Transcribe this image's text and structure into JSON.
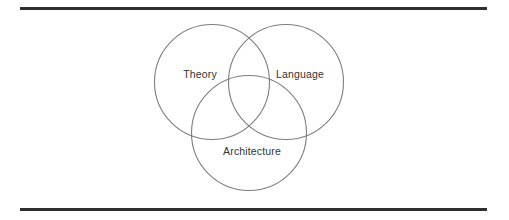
{
  "figure": {
    "type": "venn-diagram",
    "set_count": 3,
    "background_color": "#ffffff",
    "rules": {
      "line_color": "#2f2f2f",
      "top_label": "top-horizontal-rule",
      "bottom_label": "bottom-horizontal-rule"
    },
    "circle": {
      "stroke_color": "#7d7d7d",
      "fill": "none",
      "radius": 57.5
    },
    "label_color": "#333333",
    "sets": [
      {
        "id": "theory",
        "label": "Theory",
        "center_x": 212,
        "center_y": 82,
        "label_x": 200,
        "label_y": 74
      },
      {
        "id": "language",
        "label": "Language",
        "center_x": 286,
        "center_y": 82,
        "label_x": 300,
        "label_y": 74
      },
      {
        "id": "architecture",
        "label": "Architecture",
        "center_x": 249,
        "center_y": 133,
        "label_x": 252,
        "label_y": 151
      }
    ]
  }
}
